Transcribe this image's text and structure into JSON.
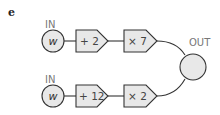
{
  "panel_label": "e",
  "colors": {
    "fill": "#e8e8e8",
    "stroke": "#333333",
    "label": "#777777"
  },
  "rows": [
    {
      "input_label": "IN",
      "variable": "w",
      "ops": [
        "+ 2",
        "× 7"
      ]
    },
    {
      "input_label": "IN",
      "variable": "w",
      "ops": [
        "+ 12",
        "× 2"
      ]
    }
  ],
  "output_label": "OUT"
}
